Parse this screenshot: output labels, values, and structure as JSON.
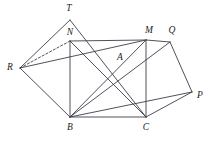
{
  "figure": {
    "kind": "geometry-diagram",
    "stroke_color": "#3d3d47",
    "label_color": "#1d1d22",
    "background_color": "#ffffff",
    "width": 210,
    "height": 150
  },
  "points": {
    "T": {
      "label": "T",
      "x": 70,
      "y": 20,
      "label_x": 69,
      "label_y": 9
    },
    "N": {
      "label": "N",
      "x": 70,
      "y": 41,
      "label_x": 70,
      "label_y": 33
    },
    "M": {
      "label": "M",
      "x": 146,
      "y": 40,
      "label_x": 149,
      "label_y": 31
    },
    "Q": {
      "label": "Q",
      "x": 170,
      "y": 42,
      "label_x": 172,
      "label_y": 31
    },
    "R": {
      "label": "R",
      "x": 20,
      "y": 68,
      "label_x": 10,
      "label_y": 68
    },
    "A": {
      "label": "A",
      "x": 118,
      "y": 66,
      "label_x": 120,
      "label_y": 58
    },
    "P": {
      "label": "P",
      "x": 192,
      "y": 92,
      "label_x": 200,
      "label_y": 96
    },
    "B": {
      "label": "B",
      "x": 70,
      "y": 117,
      "label_x": 70,
      "label_y": 128
    },
    "C": {
      "label": "C",
      "x": 146,
      "y": 117,
      "label_x": 146,
      "label_y": 128
    }
  },
  "segments": [
    {
      "name": "segment-R-T",
      "from": "R",
      "to": "T",
      "style": "solid"
    },
    {
      "name": "segment-T-C",
      "from": "T",
      "to": "C",
      "style": "solid"
    },
    {
      "name": "segment-R-N",
      "from": "R",
      "to": "N",
      "style": "dashed"
    },
    {
      "name": "segment-R-M",
      "from": "R",
      "to": "M",
      "style": "solid"
    },
    {
      "name": "segment-R-B",
      "from": "R",
      "to": "B",
      "style": "solid"
    },
    {
      "name": "segment-N-M",
      "from": "N",
      "to": "M",
      "style": "solid"
    },
    {
      "name": "segment-N-B",
      "from": "N",
      "to": "B",
      "style": "solid"
    },
    {
      "name": "segment-N-C",
      "from": "N",
      "to": "C",
      "style": "solid"
    },
    {
      "name": "segment-M-C",
      "from": "M",
      "to": "C",
      "style": "solid"
    },
    {
      "name": "segment-B-C",
      "from": "B",
      "to": "C",
      "style": "solid"
    },
    {
      "name": "segment-B-M",
      "from": "B",
      "to": "M",
      "style": "solid"
    },
    {
      "name": "segment-B-Q",
      "from": "B",
      "to": "Q",
      "style": "solid"
    },
    {
      "name": "segment-B-P",
      "from": "B",
      "to": "P",
      "style": "solid"
    },
    {
      "name": "segment-M-Q",
      "from": "M",
      "to": "Q",
      "style": "solid"
    },
    {
      "name": "segment-Q-P",
      "from": "Q",
      "to": "P",
      "style": "solid"
    },
    {
      "name": "segment-P-C",
      "from": "P",
      "to": "C",
      "style": "solid"
    }
  ]
}
